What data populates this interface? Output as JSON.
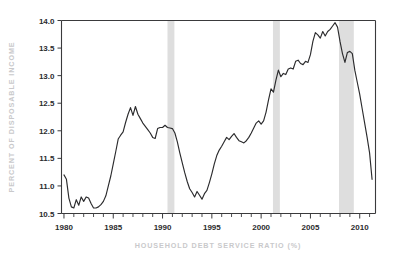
{
  "chart_data": {
    "type": "line",
    "title": "",
    "subtitle": "",
    "xlabel": "HOUSEHOLD DEBT SERVICE RATIO (%)",
    "ylabel": "PERCENT OF DISPOSABLE INCOME",
    "xlim": [
      1979.75,
      2011.6
    ],
    "ylim": [
      10.5,
      14.0
    ],
    "xticks": [
      1980,
      1985,
      1990,
      1995,
      2000,
      2005,
      2010
    ],
    "xtick_labels": [
      "1980",
      "1985",
      "1990",
      "1995",
      "2000",
      "2005",
      "2010"
    ],
    "yticks": [
      10.5,
      11.0,
      11.5,
      12.0,
      12.5,
      13.0,
      13.5,
      14.0
    ],
    "ytick_labels": [
      "10.5",
      "11.0",
      "11.5",
      "12.0",
      "12.5",
      "13.0",
      "13.5",
      "14.0"
    ],
    "minor_xtick_interval": 1,
    "grid": false,
    "legend": "none",
    "line_color": "#2b2b2d",
    "band_color": "#dedede",
    "axis_title_color": "#c9c9cb",
    "tick_label_color": "#2b2b2d",
    "background_color": "#ffffff",
    "shaded_regions": [
      {
        "label": "recession-1990-1991",
        "start": 1990.5,
        "end": 1991.2
      },
      {
        "label": "recession-2001",
        "start": 2001.2,
        "end": 2001.9
      },
      {
        "label": "recession-2007-2009",
        "start": 2007.9,
        "end": 2009.4
      }
    ],
    "series": [
      {
        "name": "Household debt service ratio",
        "x": [
          1980.0,
          1980.25,
          1980.5,
          1980.75,
          1981.0,
          1981.25,
          1981.5,
          1981.75,
          1982.0,
          1982.25,
          1982.5,
          1982.75,
          1983.0,
          1983.25,
          1983.5,
          1983.75,
          1984.0,
          1984.25,
          1984.5,
          1984.75,
          1985.0,
          1985.25,
          1985.5,
          1985.75,
          1986.0,
          1986.25,
          1986.5,
          1986.75,
          1987.0,
          1987.25,
          1987.5,
          1987.75,
          1988.0,
          1988.25,
          1988.5,
          1988.75,
          1989.0,
          1989.25,
          1989.5,
          1989.75,
          1990.0,
          1990.25,
          1990.5,
          1990.75,
          1991.0,
          1991.25,
          1991.5,
          1991.75,
          1992.0,
          1992.25,
          1992.5,
          1992.75,
          1993.0,
          1993.25,
          1993.5,
          1993.75,
          1994.0,
          1994.25,
          1994.5,
          1994.75,
          1995.0,
          1995.25,
          1995.5,
          1995.75,
          1996.0,
          1996.25,
          1996.5,
          1996.75,
          1997.0,
          1997.25,
          1997.5,
          1997.75,
          1998.0,
          1998.25,
          1998.5,
          1998.75,
          1999.0,
          1999.25,
          1999.5,
          1999.75,
          2000.0,
          2000.25,
          2000.5,
          2000.75,
          2001.0,
          2001.25,
          2001.5,
          2001.75,
          2002.0,
          2002.25,
          2002.5,
          2002.75,
          2003.0,
          2003.25,
          2003.5,
          2003.75,
          2004.0,
          2004.25,
          2004.5,
          2004.75,
          2005.0,
          2005.25,
          2005.5,
          2005.75,
          2006.0,
          2006.25,
          2006.5,
          2006.75,
          2007.0,
          2007.25,
          2007.5,
          2007.75,
          2008.0,
          2008.25,
          2008.5,
          2008.75,
          2009.0,
          2009.25,
          2009.5,
          2009.75,
          2010.0,
          2010.25,
          2010.5,
          2010.75,
          2011.0,
          2011.25
        ],
        "values": [
          11.2,
          11.12,
          10.78,
          10.62,
          10.6,
          10.75,
          10.65,
          10.8,
          10.72,
          10.8,
          10.78,
          10.68,
          10.6,
          10.6,
          10.62,
          10.66,
          10.72,
          10.82,
          11.0,
          11.18,
          11.4,
          11.62,
          11.85,
          11.92,
          11.98,
          12.15,
          12.3,
          12.42,
          12.28,
          12.44,
          12.3,
          12.22,
          12.14,
          12.08,
          12.02,
          11.96,
          11.88,
          11.86,
          12.04,
          12.06,
          12.06,
          12.1,
          12.06,
          12.05,
          12.04,
          11.96,
          11.8,
          11.6,
          11.42,
          11.24,
          11.08,
          10.95,
          10.88,
          10.8,
          10.9,
          10.83,
          10.76,
          10.86,
          10.92,
          11.06,
          11.22,
          11.4,
          11.55,
          11.65,
          11.72,
          11.8,
          11.88,
          11.84,
          11.9,
          11.95,
          11.88,
          11.82,
          11.8,
          11.78,
          11.82,
          11.88,
          11.96,
          12.05,
          12.14,
          12.18,
          12.12,
          12.18,
          12.34,
          12.56,
          12.76,
          12.7,
          12.92,
          13.1,
          12.98,
          13.04,
          13.02,
          13.12,
          13.14,
          13.12,
          13.26,
          13.28,
          13.22,
          13.2,
          13.26,
          13.24,
          13.38,
          13.62,
          13.78,
          13.74,
          13.68,
          13.8,
          13.72,
          13.8,
          13.84,
          13.9,
          13.96,
          13.88,
          13.62,
          13.4,
          13.24,
          13.42,
          13.44,
          13.4,
          13.1,
          12.88,
          12.66,
          12.4,
          12.14,
          11.88,
          11.6,
          11.12
        ]
      }
    ],
    "annotations": []
  }
}
